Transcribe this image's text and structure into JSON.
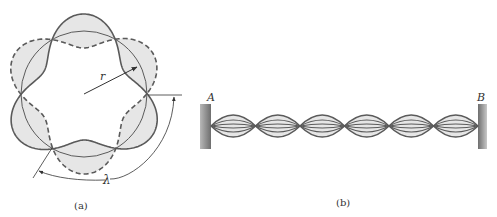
{
  "panel_a": {
    "caption": "(a)",
    "radius_label": "r",
    "wavelength_label": "λ",
    "node_count": 6,
    "description": "Standing wave on a circular orbit: solid and dashed loops oscillate about a circle of radius r"
  },
  "panel_b": {
    "caption": "(b)",
    "left_end_label": "A",
    "right_end_label": "B",
    "loop_count": 6,
    "description": "Standing wave on a string fixed at both ends A and B"
  },
  "colors": {
    "stroke": "#5a5a5a",
    "fill": "#e6e6e6",
    "wall": "#8a8a8a"
  }
}
